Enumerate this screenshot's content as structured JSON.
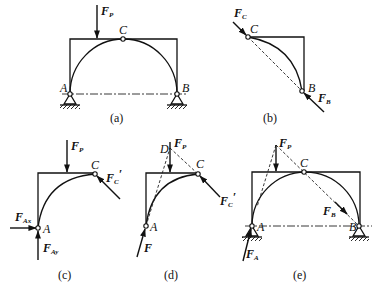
{
  "figure": {
    "panels": [
      {
        "id": "a",
        "caption": "(a)",
        "labels": {
          "A": "A",
          "B": "B",
          "C": "C"
        },
        "forces": [
          {
            "name": "F",
            "sub": "P"
          }
        ]
      },
      {
        "id": "b",
        "caption": "(b)",
        "labels": {
          "B": "B",
          "C": "C"
        },
        "forces": [
          {
            "name": "F",
            "sub": "C"
          },
          {
            "name": "F",
            "sub": "B"
          }
        ]
      },
      {
        "id": "c",
        "caption": "(c)",
        "labels": {
          "A": "A",
          "C": "C"
        },
        "forces": [
          {
            "name": "F",
            "sub": "P"
          },
          {
            "name": "F",
            "sub": "C",
            "prime": "′"
          },
          {
            "name": "F",
            "sub": "Ax"
          },
          {
            "name": "F",
            "sub": "Ay"
          }
        ]
      },
      {
        "id": "d",
        "caption": "(d)",
        "labels": {
          "A": "A",
          "C": "C",
          "D": "D"
        },
        "forces": [
          {
            "name": "F",
            "sub": "P"
          },
          {
            "name": "F",
            "sub": "C",
            "prime": "′"
          },
          {
            "name": "F",
            "sub": ""
          }
        ]
      },
      {
        "id": "e",
        "caption": "(e)",
        "labels": {
          "A": "A",
          "B": "B",
          "C": "C"
        },
        "forces": [
          {
            "name": "F",
            "sub": "P"
          },
          {
            "name": "F",
            "sub": "B"
          },
          {
            "name": "F",
            "sub": "A"
          }
        ]
      }
    ]
  }
}
